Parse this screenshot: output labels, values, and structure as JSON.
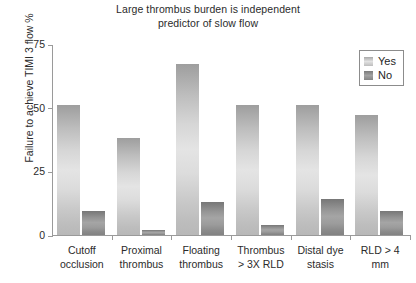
{
  "chart_data": {
    "type": "bar",
    "title": "Large thrombus burden is independent predictor of slow flow",
    "title_lines": [
      "Large thrombus burden is independent",
      "predictor of slow flow"
    ],
    "xlabel": "",
    "ylabel": "Failure to achieve TIMI 3 flow %",
    "ylim": [
      0,
      75
    ],
    "yticks": [
      0,
      25,
      50,
      75
    ],
    "ytick_labels": [
      "0",
      "25",
      "50",
      "75"
    ],
    "grid": false,
    "legend_position": "top-right-inside",
    "categories": [
      "Cutoff occlusion",
      "Proximal thrombus",
      "Floating thrombus",
      "Thrombus > 3X RLD",
      "Distal dye stasis",
      "RLD > 4 mm"
    ],
    "category_lines": [
      [
        "Cutoff",
        "occlusion"
      ],
      [
        "Proximal",
        "thrombus"
      ],
      [
        "Floating",
        "thrombus"
      ],
      [
        "Thrombus",
        "> 3X RLD"
      ],
      [
        "Distal dye",
        "stasis"
      ],
      [
        "RLD > 4",
        "mm"
      ]
    ],
    "series": [
      {
        "name": "Yes",
        "color": "#d8d8d8",
        "values": [
          51,
          38,
          67,
          51,
          51,
          47
        ]
      },
      {
        "name": "No",
        "color": "#8f8f8f",
        "values": [
          9.5,
          2,
          13,
          4,
          14,
          9.5
        ]
      }
    ]
  },
  "legend": {
    "items": [
      {
        "label": "Yes"
      },
      {
        "label": "No"
      }
    ]
  },
  "axis": {
    "tick_0": "0",
    "tick_25": "25",
    "tick_50": "50",
    "tick_75": "75"
  }
}
